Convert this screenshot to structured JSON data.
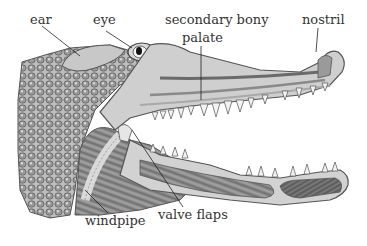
{
  "diagram": {
    "labels": {
      "ear": "ear",
      "eye": "eye",
      "palate_line1": "secondary bony",
      "palate_line2": "palate",
      "nostril": "nostril",
      "windpipe": "windpipe",
      "valve_flaps": "valve flaps"
    }
  }
}
